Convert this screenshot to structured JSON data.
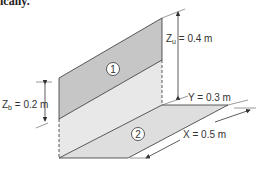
{
  "caption": "ically.",
  "colors": {
    "panel1": "#c8c8c8",
    "panel_lower": "#e6e6e6",
    "floor": "#dcdcdc",
    "line": "#333333"
  },
  "panels": {
    "panel1_label": "1",
    "panel2_label": "2"
  },
  "dimensions": {
    "zu": {
      "symbol": "Z",
      "sub": "u",
      "value": " = 0.4 m"
    },
    "zb": {
      "symbol": "Z",
      "sub": "b",
      "value": " = 0.2 m"
    },
    "y": {
      "text": "Y = 0.3 m"
    },
    "x": {
      "text": "X = 0.5 m"
    }
  }
}
